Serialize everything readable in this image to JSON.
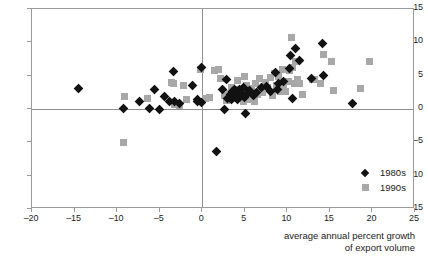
{
  "chart_data": {
    "type": "scatter",
    "title": "",
    "xlabel": "average annual percent growth of export volume",
    "ylabel": "",
    "xlim": [
      -20,
      25
    ],
    "ylim": [
      -15,
      15
    ],
    "xticks": [
      -20,
      -15,
      -10,
      -5,
      0,
      5,
      10,
      15,
      20,
      25
    ],
    "yticks": [
      -15,
      -10,
      -5,
      0,
      5,
      10,
      15
    ],
    "xtick_labels": [
      "-20",
      "-15",
      "-10",
      "-5",
      "0",
      "5",
      "10",
      "15",
      "20",
      "25"
    ],
    "ytick_labels": [
      "-15",
      "-10",
      "-5",
      "0",
      "5",
      "10",
      "15"
    ],
    "grid": false,
    "zero_lines": true,
    "legend_position": "lower right inside",
    "series": [
      {
        "name": "1980s",
        "marker": "diamond",
        "color": "#121212",
        "points": [
          [
            -14.5,
            3.1
          ],
          [
            -9.3,
            0.1
          ],
          [
            -7.4,
            1.2
          ],
          [
            -6.2,
            0.1
          ],
          [
            -5.6,
            2.9
          ],
          [
            -5.0,
            0.0
          ],
          [
            -4.4,
            1.9
          ],
          [
            -3.9,
            1.1
          ],
          [
            -3.4,
            5.6
          ],
          [
            -3.3,
            1.2
          ],
          [
            -2.7,
            0.9
          ],
          [
            -1.1,
            3.5
          ],
          [
            -0.6,
            1.5
          ],
          [
            -0.5,
            1.2
          ],
          [
            -0.1,
            6.2
          ],
          [
            -0.1,
            1.0
          ],
          [
            2.4,
            3.0
          ],
          [
            2.6,
            0.0
          ],
          [
            2.9,
            4.4
          ],
          [
            3.0,
            1.6
          ],
          [
            3.3,
            2.2
          ],
          [
            3.4,
            1.4
          ],
          [
            3.6,
            2.7
          ],
          [
            3.7,
            1.9
          ],
          [
            3.8,
            3.0
          ],
          [
            4.0,
            2.1
          ],
          [
            4.1,
            1.5
          ],
          [
            4.2,
            2.6
          ],
          [
            4.4,
            2.9
          ],
          [
            4.5,
            2.0
          ],
          [
            4.6,
            2.4
          ],
          [
            4.8,
            3.2
          ],
          [
            5.0,
            1.8
          ],
          [
            5.1,
            -0.7
          ],
          [
            5.3,
            2.3
          ],
          [
            5.6,
            2.8
          ],
          [
            6.0,
            2.1
          ],
          [
            6.4,
            2.5
          ],
          [
            7.0,
            3.2
          ],
          [
            7.6,
            3.4
          ],
          [
            8.0,
            2.6
          ],
          [
            8.6,
            5.5
          ],
          [
            8.8,
            3.0
          ],
          [
            9.0,
            3.8
          ],
          [
            9.6,
            4.1
          ],
          [
            10.2,
            6.1
          ],
          [
            10.4,
            8.0
          ],
          [
            10.6,
            1.6
          ],
          [
            11.0,
            9.1
          ],
          [
            11.4,
            7.3
          ],
          [
            12.8,
            4.6
          ],
          [
            14.1,
            9.8
          ],
          [
            14.2,
            5.1
          ],
          [
            17.7,
            0.9
          ],
          [
            1.7,
            -6.4
          ]
        ]
      },
      {
        "name": "1990s",
        "marker": "square",
        "color": "#a8a8a8",
        "points": [
          [
            -9.2,
            -5.0
          ],
          [
            -9.1,
            1.9
          ],
          [
            -6.4,
            1.6
          ],
          [
            -3.6,
            4.0
          ],
          [
            -3.4,
            3.9
          ],
          [
            -3.3,
            0.7
          ],
          [
            -2.7,
            0.5
          ],
          [
            -2.2,
            3.6
          ],
          [
            -1.8,
            1.4
          ],
          [
            -0.2,
            5.9
          ],
          [
            0.4,
            1.6
          ],
          [
            0.9,
            1.7
          ],
          [
            1.5,
            5.8
          ],
          [
            1.9,
            6.0
          ],
          [
            2.2,
            4.6
          ],
          [
            2.6,
            2.1
          ],
          [
            2.9,
            1.3
          ],
          [
            3.2,
            2.4
          ],
          [
            3.4,
            3.3
          ],
          [
            3.6,
            1.9
          ],
          [
            3.8,
            2.7
          ],
          [
            4.0,
            1.6
          ],
          [
            4.2,
            4.3
          ],
          [
            4.4,
            3.0
          ],
          [
            4.5,
            2.0
          ],
          [
            4.7,
            2.5
          ],
          [
            4.9,
            1.2
          ],
          [
            5.0,
            4.9
          ],
          [
            5.2,
            3.6
          ],
          [
            5.4,
            2.8
          ],
          [
            5.6,
            1.5
          ],
          [
            5.8,
            3.1
          ],
          [
            6.0,
            2.4
          ],
          [
            6.1,
            1.1
          ],
          [
            6.3,
            3.8
          ],
          [
            6.5,
            2.2
          ],
          [
            6.7,
            4.6
          ],
          [
            6.9,
            3.0
          ],
          [
            7.1,
            2.5
          ],
          [
            7.4,
            4.0
          ],
          [
            7.7,
            3.3
          ],
          [
            8.0,
            4.7
          ],
          [
            8.2,
            2.1
          ],
          [
            8.5,
            5.3
          ],
          [
            8.7,
            3.6
          ],
          [
            9.0,
            4.9
          ],
          [
            9.2,
            2.6
          ],
          [
            9.4,
            6.0
          ],
          [
            9.6,
            3.2
          ],
          [
            9.8,
            2.7
          ],
          [
            10.1,
            4.2
          ],
          [
            10.3,
            5.8
          ],
          [
            10.5,
            10.7
          ],
          [
            10.6,
            6.2
          ],
          [
            10.8,
            3.9
          ],
          [
            11.0,
            7.2
          ],
          [
            11.2,
            4.4
          ],
          [
            11.4,
            3.8
          ],
          [
            11.8,
            2.2
          ],
          [
            12.9,
            4.5
          ],
          [
            13.2,
            4.4
          ],
          [
            13.9,
            3.9
          ],
          [
            14.3,
            8.2
          ],
          [
            15.2,
            7.2
          ],
          [
            15.4,
            2.8
          ],
          [
            18.6,
            3.1
          ],
          [
            19.7,
            7.1
          ]
        ]
      }
    ]
  },
  "legend": {
    "items": [
      {
        "label": "1980s",
        "marker": "diamond",
        "color": "#121212"
      },
      {
        "label": "1990s",
        "marker": "square",
        "color": "#a8a8a8"
      }
    ]
  },
  "axis_title": {
    "line1": "average annual percent growth",
    "line2": "of export volume"
  }
}
